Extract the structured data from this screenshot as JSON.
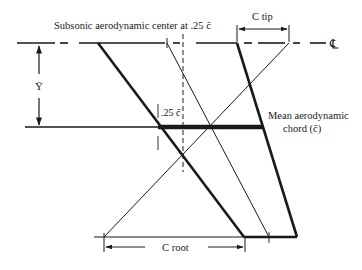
{
  "diagram": {
    "labels": {
      "ac_label": "Subsonic aerodynamic center at .25 c̄",
      "c_tip": "C tip",
      "centerline": "℄",
      "y_bar": "Ȳ",
      "quarter_chord": ".25 c̄",
      "mac_line1": "Mean aerodynamic",
      "mac_line2": "chord (c̄)",
      "c_root": "C root"
    },
    "colors": {
      "ink": "#1a1a1a",
      "background": "#ffffff"
    }
  }
}
